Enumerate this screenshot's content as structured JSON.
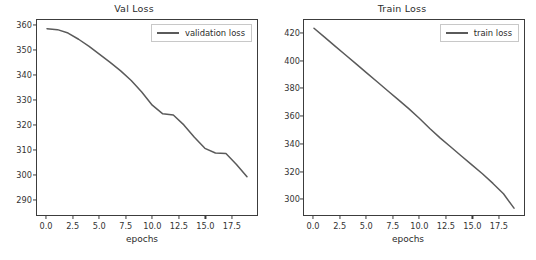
{
  "figure": {
    "background": "#ffffff",
    "line_color": "#5a5a5a",
    "axis_color": "#3c3c3c",
    "text_color": "#2b2b2b"
  },
  "chart_data": [
    {
      "type": "line",
      "title": "Val Loss",
      "xlabel": "epochs",
      "ylabel": "",
      "xlim": [
        -0.95,
        19.95
      ],
      "ylim": [
        283.5,
        362.5
      ],
      "grid": false,
      "legend_position": "upper right",
      "xticks": [
        "0.0",
        "2.5",
        "5.0",
        "7.5",
        "10.0",
        "12.5",
        "15.0",
        "17.5"
      ],
      "xtick_values": [
        0.0,
        2.5,
        5.0,
        7.5,
        10.0,
        12.5,
        15.0,
        17.5
      ],
      "yticks": [
        "290",
        "300",
        "310",
        "320",
        "330",
        "340",
        "350",
        "360"
      ],
      "ytick_values": [
        290,
        300,
        310,
        320,
        330,
        340,
        350,
        360
      ],
      "series": [
        {
          "name": "validation loss",
          "color": "#5a5a5a",
          "x": [
            0,
            1,
            2,
            3,
            4,
            5,
            6,
            7,
            8,
            9,
            10,
            11,
            12,
            13,
            14,
            15,
            16,
            17,
            18,
            19
          ],
          "values": [
            359.0,
            358.6,
            357.2,
            354.7,
            351.8,
            348.6,
            345.3,
            341.9,
            338.0,
            333.3,
            328.0,
            324.5,
            324.0,
            320.0,
            315.0,
            310.5,
            308.6,
            308.4,
            304.0,
            299.0,
            286.0
          ]
        }
      ]
    },
    {
      "type": "line",
      "title": "Train Loss",
      "xlabel": "epochs",
      "ylabel": "",
      "xlim": [
        -0.95,
        19.95
      ],
      "ylim": [
        288.0,
        430.0
      ],
      "grid": false,
      "legend_position": "upper right",
      "xticks": [
        "0.0",
        "2.5",
        "5.0",
        "7.5",
        "10.0",
        "12.5",
        "15.0",
        "17.5"
      ],
      "xtick_values": [
        0.0,
        2.5,
        5.0,
        7.5,
        10.0,
        12.5,
        15.0,
        17.5
      ],
      "yticks": [
        "300",
        "320",
        "340",
        "360",
        "380",
        "400",
        "420"
      ],
      "ytick_values": [
        300,
        320,
        340,
        360,
        380,
        400,
        420
      ],
      "series": [
        {
          "name": "train loss",
          "color": "#5a5a5a",
          "x": [
            0,
            1,
            2,
            3,
            4,
            5,
            6,
            7,
            8,
            9,
            10,
            11,
            12,
            13,
            14,
            15,
            16,
            17,
            18,
            19
          ],
          "values": [
            424.0,
            417.5,
            411.0,
            404.5,
            398.0,
            391.5,
            385.0,
            378.5,
            372.0,
            365.5,
            358.5,
            351.0,
            344.0,
            337.5,
            331.0,
            324.5,
            318.0,
            311.0,
            303.5,
            293.0
          ]
        }
      ]
    }
  ]
}
